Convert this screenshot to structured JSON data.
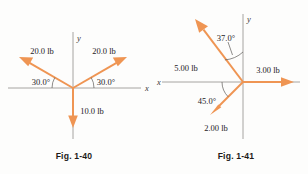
{
  "page": {
    "background_color": "#fdfdfc",
    "vector_color": "#ef9553",
    "axis_color": "#9c9a97",
    "text_color": "#25211f"
  },
  "figures": [
    {
      "id": "fig-1-40",
      "caption": "Fig. 1-40",
      "axis_labels": {
        "x": "x",
        "y": "y"
      },
      "origin": {
        "x": 73,
        "y": 88
      },
      "vectors": [
        {
          "name": "vector-20lb-left",
          "label": "20.0 lb",
          "magnitude": "20.0",
          "unit": "lb",
          "angle_deg": 150,
          "angle_label": "30.0°",
          "label_x": 42,
          "label_y": 54,
          "angle_label_x": 26,
          "angle_label_y": 85
        },
        {
          "name": "vector-20lb-right",
          "label": "20.0 lb",
          "magnitude": "20.0",
          "unit": "lb",
          "angle_deg": 30,
          "angle_label": "30.0°",
          "label_x": 85,
          "label_y": 54,
          "angle_label_x": 87,
          "angle_label_y": 85
        },
        {
          "name": "vector-10lb-down",
          "label": "10.0 lb",
          "magnitude": "10.0",
          "unit": "lb",
          "angle_deg": 270,
          "angle_label": "",
          "label_x": 80,
          "label_y": 113,
          "angle_label_x": 0,
          "angle_label_y": 0
        }
      ]
    },
    {
      "id": "fig-1-41",
      "caption": "Fig. 1-41",
      "axis_labels": {
        "x": "x",
        "y": "y"
      },
      "origin": {
        "x": 243,
        "y": 82
      },
      "vectors": [
        {
          "name": "vector-5lb-upper-left",
          "label": "5.00 lb",
          "magnitude": "5.00",
          "unit": "lb",
          "angle_deg": 127,
          "angle_label": "37.0°",
          "label_x": 170,
          "label_y": 68,
          "angle_label_x": 212,
          "angle_label_y": 47
        },
        {
          "name": "vector-3lb-right",
          "label": "3.00 lb",
          "magnitude": "3.00",
          "unit": "lb",
          "angle_deg": 0,
          "angle_label": "",
          "label_x": 250,
          "label_y": 76,
          "angle_label_x": 0,
          "angle_label_y": 0
        },
        {
          "name": "vector-2lb-lower-left",
          "label": "2.00 lb",
          "magnitude": "2.00",
          "unit": "lb",
          "angle_deg": 225,
          "angle_label": "45.0°",
          "label_x": 200,
          "label_y": 131,
          "angle_label_x": 196,
          "angle_label_y": 103
        }
      ]
    }
  ]
}
